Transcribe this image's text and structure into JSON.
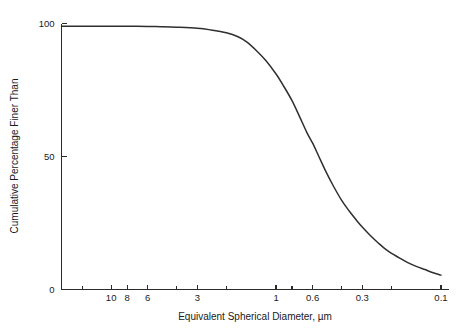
{
  "chart_data": {
    "type": "line",
    "title": "",
    "xlabel": "Equivalent Spherical Diameter, µm",
    "ylabel": "Cumulative Percentage Finer Than",
    "xscale": "log",
    "x_reversed": true,
    "xlim": [
      20,
      0.09
    ],
    "ylim": [
      0,
      100
    ],
    "grid": false,
    "legend": null,
    "x_ticks_labeled": [
      {
        "value": 10,
        "label": "10"
      },
      {
        "value": 8,
        "label": "8"
      },
      {
        "value": 6,
        "label": "6"
      },
      {
        "value": 3,
        "label": "3"
      },
      {
        "value": 1,
        "label": "1"
      },
      {
        "value": 0.6,
        "label": "0.6"
      },
      {
        "value": 0.3,
        "label": "0.3"
      },
      {
        "value": 0.1,
        "label": "0.1"
      }
    ],
    "x_ticks_unlabeled": [
      20,
      15,
      4,
      2,
      0.8,
      0.4,
      0.2
    ],
    "y_ticks": [
      {
        "value": 0,
        "label": "0"
      },
      {
        "value": 50,
        "label": "50"
      },
      {
        "value": 100,
        "label": "100"
      }
    ],
    "series": [
      {
        "name": "Cumulative percentage finer",
        "x": [
          20.0,
          15.0,
          12.0,
          10.0,
          8.0,
          6.0,
          5.0,
          4.0,
          3.0,
          2.5,
          2.0,
          1.7,
          1.5,
          1.3,
          1.15,
          1.0,
          0.9,
          0.8,
          0.72,
          0.65,
          0.6,
          0.55,
          0.5,
          0.45,
          0.4,
          0.36,
          0.32,
          0.3,
          0.27,
          0.24,
          0.21,
          0.18,
          0.16,
          0.14,
          0.125,
          0.115,
          0.105,
          0.1
        ],
        "y": [
          99.0,
          99.0,
          99.0,
          99.0,
          99.0,
          98.9,
          98.8,
          98.6,
          98.2,
          97.6,
          96.5,
          95.0,
          93.0,
          89.5,
          86.0,
          81.0,
          76.5,
          71.0,
          65.0,
          59.0,
          55.0,
          50.0,
          44.5,
          39.0,
          33.5,
          29.5,
          25.5,
          23.5,
          20.5,
          17.5,
          14.5,
          12.0,
          10.2,
          8.6,
          7.5,
          6.6,
          5.8,
          5.4
        ]
      }
    ]
  },
  "axis_titles": {
    "x": "Equivalent Spherical Diameter, µm",
    "y": "Cumulative Percentage Finer Than"
  }
}
